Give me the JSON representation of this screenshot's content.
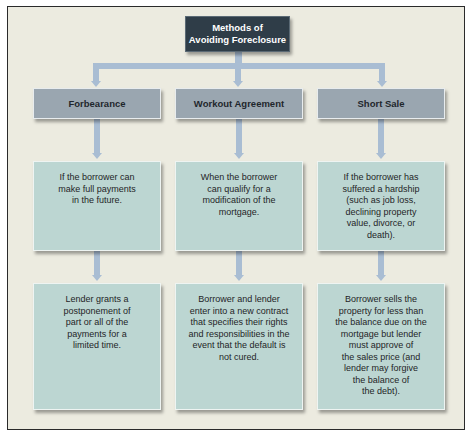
{
  "diagram": {
    "title": {
      "line1": "Methods of",
      "line2": "Avoiding Foreclosure"
    },
    "columns": [
      {
        "header": "Forbearance",
        "condition": "If the borrower can\nmake full payments\nin the future.",
        "outcome": "Lender grants a\npostponement of\npart or all of the\npayments for a\nlimited time."
      },
      {
        "header": "Workout Agreement",
        "condition": "When the borrower\ncan qualify for a\nmodification of the\nmortgage.",
        "outcome": "Borrower and lender\nenter into a new contract\nthat specifies their rights\nand responsibilities in the\nevent that the default is\nnot cured."
      },
      {
        "header": "Short Sale",
        "condition": "If the borrower has\nsuffered a hardship\n(such as job loss,\ndeclining property\nvalue, divorce, or\ndeath).",
        "outcome": "Borrower sells the\nproperty for less than\nthe balance due on the\nmortgage but lender\nmust approve of\nthe sales price (and\nlender may forgive\nthe balance of\nthe debt)."
      }
    ],
    "colors": {
      "frame_background": "#ecebe0",
      "title_box": "#2f3d48",
      "header_box": "#9aa6b0",
      "text_box": "#bcd6d2",
      "connector": "#a9bdd3"
    }
  }
}
